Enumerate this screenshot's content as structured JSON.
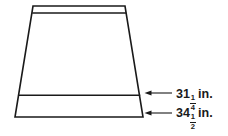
{
  "figure": {
    "name": "trapezoid-skirt-diagram",
    "background_color": "#ffffff",
    "line_color": "#1a1a1a",
    "shape": {
      "type": "trapezoid",
      "top_left": [
        33,
        6
      ],
      "top_right": [
        125,
        6
      ],
      "bottom_left": [
        15,
        117
      ],
      "bottom_right": [
        143,
        117
      ],
      "inner_lines": [
        {
          "name": "waistband-line",
          "y": 13,
          "from_x": 32,
          "to_x": 126
        },
        {
          "name": "hem-line",
          "y": 95,
          "from_x": 18,
          "to_x": 140
        }
      ]
    }
  },
  "dimensions": [
    {
      "id": "upper",
      "name": "hem-width-dimension",
      "whole": "31",
      "numerator": "1",
      "denominator": "4",
      "unit": "in.",
      "full_text": "31 1/4 in.",
      "points_to": "hem-line",
      "arrow_direction": "left",
      "arrow_y": 93,
      "arrow_tip_x": 145,
      "arrow_tail_x": 172
    },
    {
      "id": "lower",
      "name": "bottom-width-dimension",
      "whole": "34",
      "numerator": "1",
      "denominator": "2",
      "unit": "in.",
      "full_text": "34 1/2 in.",
      "points_to": "bottom-edge",
      "arrow_direction": "left",
      "arrow_y": 113,
      "arrow_tip_x": 145,
      "arrow_tail_x": 172
    }
  ]
}
